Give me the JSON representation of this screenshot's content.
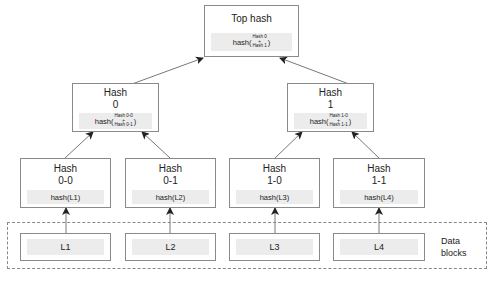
{
  "diagram": {
    "type": "merkle-tree",
    "top": {
      "title": "Top hash",
      "formula_prefix": "hash(",
      "formula_top": "Hash 0",
      "formula_plus": "+",
      "formula_bottom": "Hash 1",
      "formula_suffix": ")"
    },
    "level1": [
      {
        "title_line1": "Hash",
        "title_line2": "0",
        "formula_prefix": "hash(",
        "formula_top": "Hash 0-0",
        "formula_plus": "+",
        "formula_bottom": "Hash 0-1",
        "formula_suffix": ")"
      },
      {
        "title_line1": "Hash",
        "title_line2": "1",
        "formula_prefix": "hash(",
        "formula_top": "Hash 1-0",
        "formula_plus": "+",
        "formula_bottom": "Hash 1-1",
        "formula_suffix": ")"
      }
    ],
    "level2": [
      {
        "title_line1": "Hash",
        "title_line2": "0-0",
        "formula": "hash(L1)"
      },
      {
        "title_line1": "Hash",
        "title_line2": "0-1",
        "formula": "hash(L2)"
      },
      {
        "title_line1": "Hash",
        "title_line2": "1-0",
        "formula": "hash(L3)"
      },
      {
        "title_line1": "Hash",
        "title_line2": "1-1",
        "formula": "hash(L4)"
      }
    ],
    "data_blocks": {
      "label_line1": "Data",
      "label_line2": "blocks",
      "items": [
        "L1",
        "L2",
        "L3",
        "L4"
      ]
    },
    "colors": {
      "border": "#8a8a8a",
      "inner_fill": "#ececec",
      "arrow": "#333333",
      "dashed": "#888888"
    }
  }
}
